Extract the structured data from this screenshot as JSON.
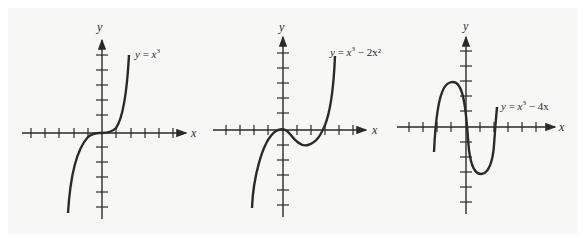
{
  "figure": {
    "graphs": [
      {
        "id": "cubic",
        "equation": "y = x³",
        "eq_parts": {
          "lhs": "y",
          "eq": "=",
          "base": "x",
          "exp": "3",
          "rest": ""
        },
        "x_axis_label": "x",
        "y_axis_label": "y"
      },
      {
        "id": "cubic-minus-2x2",
        "equation": "y = x³ − 2x²",
        "eq_parts": {
          "lhs": "y",
          "eq": "=",
          "base": "x",
          "exp": "3",
          "rest": "− 2x²"
        },
        "x_axis_label": "x",
        "y_axis_label": "y"
      },
      {
        "id": "cubic-minus-4x",
        "equation": "y = x³ − 4x",
        "eq_parts": {
          "lhs": "y",
          "eq": "=",
          "base": "x",
          "exp": "3",
          "rest": "− 4x"
        },
        "x_axis_label": "x",
        "y_axis_label": "y"
      }
    ]
  },
  "colors": {
    "background": "#f7f7f6",
    "ink": "#2a2a2a"
  }
}
